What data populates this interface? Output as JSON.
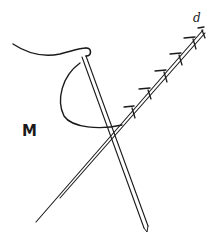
{
  "figure": {
    "label": "M",
    "end_mark": "d",
    "stroke_color": "#1a1a1a",
    "background_color": "#ffffff",
    "elements": [
      "thread-curve",
      "thread-loop",
      "vertical-needle",
      "thread-arc",
      "diagonal-needle",
      "stitch-ticks"
    ],
    "stitch_count": 7
  }
}
